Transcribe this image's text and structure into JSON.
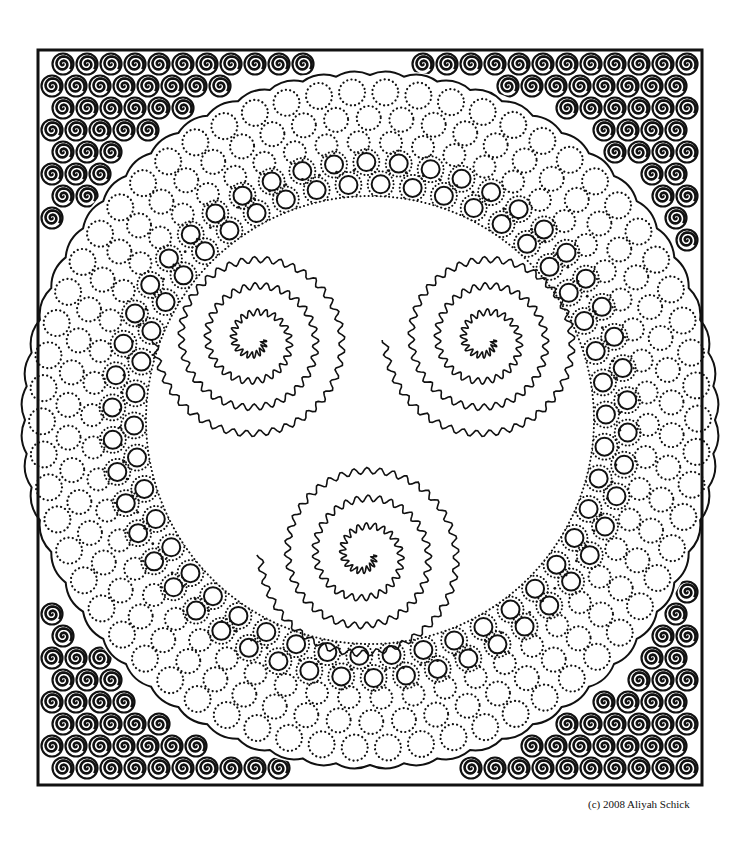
{
  "artwork": {
    "title": "Spiral mandala coloring page",
    "caption": "(c) 2008 Aliyah Schick",
    "colors": {
      "ink": "#111111",
      "paper": "#ffffff"
    },
    "frame": {
      "x": 38,
      "y": 50,
      "w": 664,
      "h": 735
    },
    "mandala": {
      "cx": 370,
      "cy": 420,
      "outer_r": 345,
      "inner_r": 245
    },
    "triple_spirals": [
      {
        "cx": 255,
        "cy": 340,
        "turns": 3.5,
        "max_r": 100
      },
      {
        "cx": 485,
        "cy": 340,
        "turns": 3.5,
        "max_r": 100
      },
      {
        "cx": 365,
        "cy": 555,
        "turns": 3.5,
        "max_r": 105
      }
    ],
    "corner_swirls": [
      "top-left",
      "top-right",
      "bottom-left",
      "bottom-right"
    ]
  }
}
